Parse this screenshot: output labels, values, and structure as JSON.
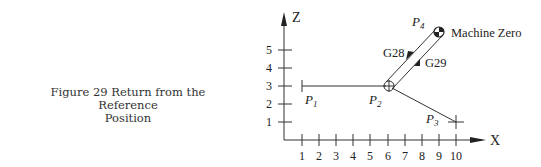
{
  "caption": {
    "line1": "Figure 29 Return from the Reference",
    "line2": "Position"
  },
  "diagram": {
    "axes": {
      "x_label": "X",
      "z_label": "Z",
      "x_ticks": [
        "1",
        "2",
        "3",
        "4",
        "5",
        "6",
        "7",
        "8",
        "9",
        "10"
      ],
      "z_ticks": [
        "1",
        "2",
        "3",
        "4",
        "5"
      ]
    },
    "points": {
      "p1": {
        "name": "P",
        "sub": "1",
        "x": 1,
        "z": 3
      },
      "p2": {
        "name": "P",
        "sub": "2",
        "x": 6,
        "z": 3
      },
      "p3": {
        "name": "P",
        "sub": "3",
        "x": 10,
        "z": 1
      },
      "p4": {
        "name": "P",
        "sub": "4",
        "x": 9,
        "z": 6
      }
    },
    "labels": {
      "g28": "G28",
      "g29": "G29",
      "machine_zero": "Machine Zero"
    },
    "colors": {
      "line": "#333333",
      "text": "#222222"
    }
  }
}
